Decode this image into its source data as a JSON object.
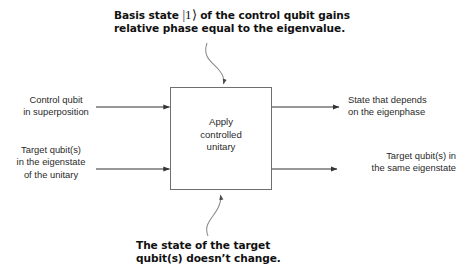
{
  "diagram": {
    "background_color": "#ffffff",
    "line_color": "#333333",
    "box_border_color": "#6f6f6f",
    "callouts": {
      "top": {
        "line1_before_ket": "Basis state",
        "ket": "|1⟩",
        "line1_after_ket": "of the control qubit gains",
        "line2": "relative phase equal to the eigenvalue."
      },
      "bottom": {
        "line1": "The state of the target",
        "line2": "qubit(s) doesn’t change."
      }
    },
    "process": {
      "line1": "Apply",
      "line2": "controlled",
      "line3": "unitary"
    },
    "inputs": [
      {
        "id": "control-in",
        "line1": "Control qubit",
        "line2": "in superposition"
      },
      {
        "id": "target-in",
        "line1": "Target qubit(s)",
        "line2": "in the eigenstate",
        "line3": "of the unitary"
      }
    ],
    "outputs": [
      {
        "id": "control-out",
        "line1": "State that depends",
        "line2": "on the eigenphase"
      },
      {
        "id": "target-out",
        "line1": "Target qubit(s) in",
        "line2": "the same eigenstate"
      }
    ]
  }
}
